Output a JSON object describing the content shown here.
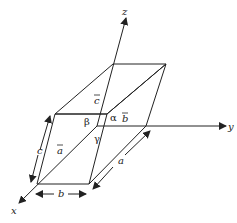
{
  "diagram": {
    "axes": {
      "x": "x",
      "y": "y",
      "z": "z"
    },
    "vectors": {
      "a": "a",
      "b": "b",
      "c": "c"
    },
    "angles": {
      "alpha": "α",
      "beta": "β",
      "gamma": "γ"
    },
    "lengths": {
      "a": "a",
      "b": "b",
      "c": "c"
    },
    "colors": {
      "stroke": "#222222",
      "background": "#ffffff"
    }
  }
}
